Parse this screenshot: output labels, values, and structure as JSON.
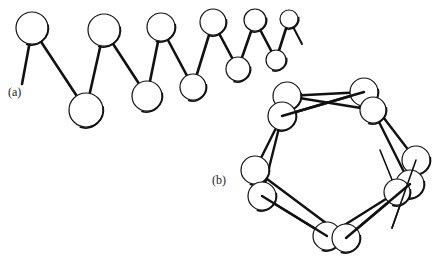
{
  "labels": {
    "a": "(a)",
    "b": "(b)"
  },
  "colors": {
    "stroke": "#111111",
    "fill": "#ffffff"
  },
  "panel_a": {
    "description": "Zigzag chain of spheres in perspective (receding to the right)",
    "spheres": [
      {
        "x": 32,
        "y": 28,
        "r": 16
      },
      {
        "x": 86,
        "y": 110,
        "r": 17
      },
      {
        "x": 104,
        "y": 30,
        "r": 16
      },
      {
        "x": 147,
        "y": 96,
        "r": 15
      },
      {
        "x": 161,
        "y": 27,
        "r": 14
      },
      {
        "x": 193,
        "y": 87,
        "r": 13
      },
      {
        "x": 213,
        "y": 22,
        "r": 13
      },
      {
        "x": 238,
        "y": 69,
        "r": 12
      },
      {
        "x": 255,
        "y": 20,
        "r": 11
      },
      {
        "x": 276,
        "y": 60,
        "r": 10
      },
      {
        "x": 289,
        "y": 19,
        "r": 9
      }
    ],
    "start_stub": {
      "x1": 32,
      "y1": 30,
      "x2": 22,
      "y2": 84
    },
    "end_stub": {
      "x1": 289,
      "y1": 19,
      "x2": 302,
      "y2": 44
    }
  },
  "panel_b": {
    "description": "Helix viewed along its axis forming a closed ring of spheres",
    "spheres": [
      {
        "x": 287,
        "y": 96,
        "r": 14
      },
      {
        "x": 364,
        "y": 92,
        "r": 14
      },
      {
        "x": 373,
        "y": 110,
        "r": 13
      },
      {
        "x": 282,
        "y": 116,
        "r": 14
      },
      {
        "x": 255,
        "y": 170,
        "r": 14
      },
      {
        "x": 262,
        "y": 196,
        "r": 14
      },
      {
        "x": 416,
        "y": 160,
        "r": 14
      },
      {
        "x": 410,
        "y": 184,
        "r": 14
      },
      {
        "x": 397,
        "y": 192,
        "r": 13
      },
      {
        "x": 327,
        "y": 236,
        "r": 14
      },
      {
        "x": 346,
        "y": 238,
        "r": 14
      }
    ],
    "bonds": [
      [
        287,
        96,
        364,
        92
      ],
      [
        282,
        116,
        364,
        92
      ],
      [
        373,
        110,
        287,
        96
      ],
      [
        364,
        92,
        416,
        160
      ],
      [
        373,
        110,
        410,
        184
      ],
      [
        282,
        116,
        255,
        170
      ],
      [
        287,
        96,
        262,
        196
      ],
      [
        255,
        170,
        346,
        238
      ],
      [
        262,
        196,
        327,
        236
      ],
      [
        327,
        236,
        397,
        192
      ],
      [
        346,
        238,
        410,
        184
      ],
      [
        416,
        160,
        397,
        192
      ]
    ],
    "stubs": [
      [
        397,
        192,
        380,
        150
      ],
      [
        416,
        160,
        392,
        228
      ]
    ]
  }
}
